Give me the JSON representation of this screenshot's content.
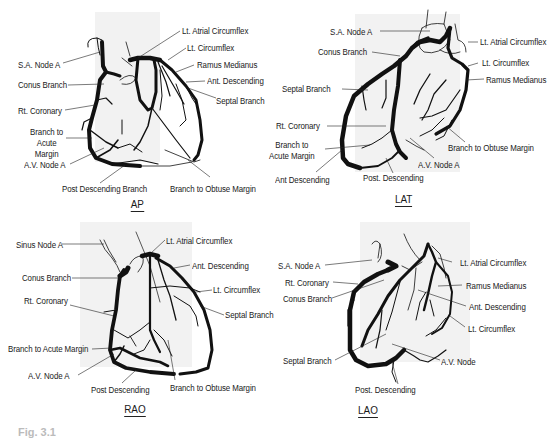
{
  "figure": {
    "caption": "Fig. 3.1",
    "panels": [
      {
        "id": "ap",
        "view_label": "AP",
        "labels": [
          "S.A. Node A",
          "Conus Branch",
          "Rt. Coronary",
          "Branch to Acute Margin",
          "A.V. Node A",
          "Post Descending Branch",
          "Lt. Atrial Circumflex",
          "Lt. Circumflex",
          "Ramus Medianus",
          "Ant. Descending",
          "Septal Branch",
          "Branch to Obtuse Margin"
        ]
      },
      {
        "id": "lat",
        "view_label": "LAT",
        "labels": [
          "S.A. Node A",
          "Conus Branch",
          "Septal Branch",
          "Rt. Coronary",
          "Branch to Acute Margin",
          "Ant Descending",
          "Post. Descending",
          "A.V. Node A",
          "Lt. Atrial Circumflex",
          "Lt. Circumflex",
          "Ramus Medianus",
          "Branch to Obtuse Margin"
        ]
      },
      {
        "id": "rao",
        "view_label": "RAO",
        "labels": [
          "Sinus Node A",
          "Conus Branch",
          "Rt. Coronary",
          "Branch to Acute Margin",
          "A.V. Node A",
          "Post Descending",
          "Lt. Atrial Circumflex",
          "Ant. Descending",
          "Lt. Circumflex",
          "Septal Branch",
          "Branch to Obtuse Margin"
        ]
      },
      {
        "id": "lao",
        "view_label": "LAO",
        "labels": [
          "S.A. Node A",
          "Rt. Coronary",
          "Conus Branch",
          "Septal Branch",
          "Post. Descending",
          "Lt. Atrial Circumflex",
          "Ramus Medianus",
          "Ant. Descending",
          "Lt. Circumflex",
          "A.V. Node"
        ]
      }
    ],
    "colors": {
      "vessel": "#111111",
      "shade": "#f0f0f0",
      "text": "#1a1a1a"
    }
  }
}
